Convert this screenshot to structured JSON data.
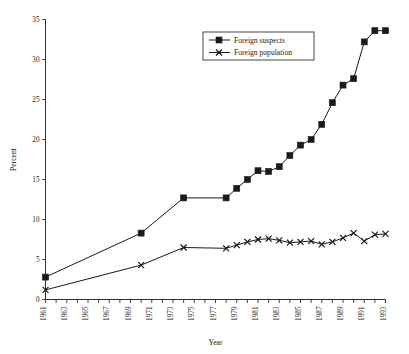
{
  "chart_data": {
    "type": "line",
    "title": "",
    "xlabel": "Year",
    "ylabel": "Percent",
    "xlim": [
      1961,
      1993
    ],
    "ylim": [
      0,
      35
    ],
    "ytick_step": 5,
    "yticks": [
      0,
      5,
      10,
      15,
      20,
      25,
      30,
      35
    ],
    "xticks": [
      1961,
      1962,
      1963,
      1964,
      1965,
      1966,
      1967,
      1968,
      1969,
      1970,
      1971,
      1972,
      1973,
      1974,
      1975,
      1976,
      1977,
      1978,
      1979,
      1980,
      1981,
      1982,
      1983,
      1984,
      1985,
      1986,
      1987,
      1988,
      1989,
      1990,
      1991,
      1992,
      1993
    ],
    "xtick_labels_shown": [
      "1961",
      "1963",
      "1965",
      "1967",
      "1969",
      "1971",
      "1973",
      "1975",
      "1977",
      "1979",
      "1981",
      "1983",
      "1985",
      "1987",
      "1989",
      "1991",
      "1993"
    ],
    "xtick_label_rotation": -90,
    "grid": false,
    "legend_position": "upper center",
    "series": [
      {
        "name": "Foreign suspects",
        "marker": "square",
        "x": [
          1961,
          1970,
          1974,
          1978,
          1979,
          1980,
          1981,
          1982,
          1983,
          1984,
          1985,
          1986,
          1987,
          1988,
          1989,
          1990,
          1991,
          1992,
          1993
        ],
        "values": [
          2.8,
          8.3,
          12.7,
          12.7,
          13.9,
          15.0,
          16.1,
          16.0,
          16.6,
          18.0,
          19.3,
          20.0,
          21.9,
          24.6,
          26.8,
          27.6,
          32.2,
          33.6,
          33.6
        ]
      },
      {
        "name": "Foreign population",
        "marker": "x",
        "x": [
          1961,
          1970,
          1974,
          1978,
          1979,
          1980,
          1981,
          1982,
          1983,
          1984,
          1985,
          1986,
          1987,
          1988,
          1989,
          1990,
          1991,
          1992,
          1993
        ],
        "values": [
          1.2,
          4.3,
          6.5,
          6.4,
          6.8,
          7.2,
          7.5,
          7.6,
          7.4,
          7.1,
          7.2,
          7.3,
          6.9,
          7.2,
          7.7,
          8.3,
          7.3,
          8.1,
          8.2
        ]
      }
    ]
  },
  "legend": {
    "entries": [
      {
        "label": "Foreign suspects",
        "marker": "square"
      },
      {
        "label": "Foreign population",
        "marker": "x"
      }
    ]
  },
  "colors": {
    "ink": "#1a1a1a",
    "background": "#ffffff"
  }
}
